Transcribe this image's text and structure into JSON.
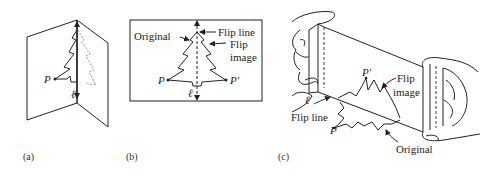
{
  "figure": {
    "panels": [
      {
        "id": "a",
        "caption": "(a)",
        "labels": {
          "point": "P",
          "line": "ℓ"
        }
      },
      {
        "id": "b",
        "caption": "(b)",
        "labels": {
          "original": "Original",
          "flip_line": "Flip line",
          "flip_image_1": "Flip",
          "flip_image_2": "image",
          "point": "P",
          "point_image": "P′",
          "line": "ℓ"
        }
      },
      {
        "id": "c",
        "caption": "(c)",
        "labels": {
          "line": "ℓ",
          "flip_line": "Flip line",
          "point": "P",
          "point_image": "P′",
          "flip_image_1": "Flip",
          "flip_image_2": "image",
          "original": "Original"
        }
      }
    ]
  }
}
